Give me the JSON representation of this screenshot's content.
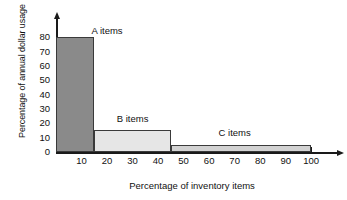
{
  "chart_data": {
    "type": "bar",
    "title": "",
    "subtitle": "",
    "xlabel": "Percentage of inventory items",
    "ylabel": "Percentage of annual dollar usage",
    "xlim": [
      0,
      105
    ],
    "ylim": [
      0,
      85
    ],
    "grid": false,
    "legend_position": "none",
    "x_ticks": [
      10,
      20,
      30,
      40,
      50,
      60,
      70,
      80,
      90,
      100
    ],
    "x_tick_labels": [
      "10",
      "20",
      "30",
      "40",
      "50",
      "60",
      "70",
      "80",
      "90",
      "100"
    ],
    "y_ticks": [
      0,
      10,
      20,
      30,
      40,
      50,
      60,
      70,
      80
    ],
    "y_tick_labels": [
      "0",
      "10",
      "20",
      "30",
      "40",
      "50",
      "60",
      "70",
      "80"
    ],
    "categories": [
      "A items",
      "B items",
      "C items"
    ],
    "values": [
      80,
      15,
      5
    ],
    "bars": [
      {
        "name": "A items",
        "label": "A items",
        "x_start": 0,
        "x_end": 15,
        "value": 80,
        "color": "#8a8a8a",
        "label_x": 20,
        "label_y": 84
      },
      {
        "name": "B items",
        "label": "B items",
        "x_start": 15,
        "x_end": 45,
        "value": 15,
        "color": "#e6e6e6",
        "label_x": 30,
        "label_y": 23
      },
      {
        "name": "C items",
        "label": "C items",
        "x_start": 45,
        "x_end": 100,
        "value": 5,
        "color": "#d2d2d2",
        "label_x": 70,
        "label_y": 13
      }
    ],
    "annotations": [
      "A items",
      "B items",
      "C items"
    ]
  },
  "axes": {
    "x_title": "Percentage of inventory items",
    "y_title": "Percentage of annual dollar usage"
  },
  "ticks": {
    "x": [
      "10",
      "20",
      "30",
      "40",
      "50",
      "60",
      "70",
      "80",
      "90",
      "100"
    ],
    "y": [
      "0",
      "10",
      "20",
      "30",
      "40",
      "50",
      "60",
      "70",
      "80"
    ]
  },
  "labels": {
    "a": "A items",
    "b": "B items",
    "c": "C items"
  },
  "colors": {
    "bar_a": "#8a8a8a",
    "bar_b": "#e6e6e6",
    "bar_c": "#d2d2d2",
    "axis": "#1a1a1a",
    "text": "#111111",
    "background": "#ffffff"
  }
}
